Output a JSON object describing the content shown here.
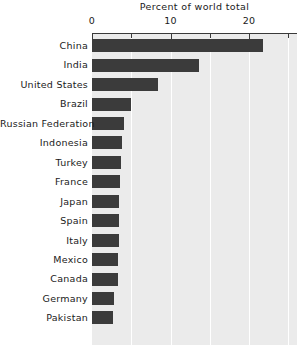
{
  "chart_data": {
    "type": "bar",
    "orientation": "horizontal",
    "title": "Percent of world total",
    "xlabel": "",
    "ylabel": "",
    "xlim": [
      0,
      26.1
    ],
    "grid": true,
    "legend": null,
    "xticks": [
      {
        "value": 0,
        "label": "0",
        "major": true
      },
      {
        "value": 5,
        "label": "",
        "major": false
      },
      {
        "value": 10,
        "label": "10",
        "major": true
      },
      {
        "value": 15,
        "label": "",
        "major": false
      },
      {
        "value": 20,
        "label": "20",
        "major": true
      },
      {
        "value": 25,
        "label": "",
        "major": false
      }
    ],
    "gridlines": [
      5,
      10,
      15,
      20,
      25
    ],
    "categories": [
      "China",
      "India",
      "United States",
      "Brazil",
      "Russian Federation",
      "Indonesia",
      "Turkey",
      "France",
      "Japan",
      "Spain",
      "Italy",
      "Mexico",
      "Canada",
      "Germany",
      "Pakistan"
    ],
    "values": [
      21.8,
      13.6,
      8.4,
      5.0,
      4.1,
      3.8,
      3.7,
      3.6,
      3.5,
      3.4,
      3.4,
      3.3,
      3.3,
      2.8,
      2.7
    ],
    "colors": {
      "bar": "#3b3b3b",
      "plot_background": "#ebebeb",
      "gridline": "#ffffff",
      "axis": "#3a3a3a",
      "text": "#1a1a1a",
      "page_background": "#ffffff"
    }
  }
}
